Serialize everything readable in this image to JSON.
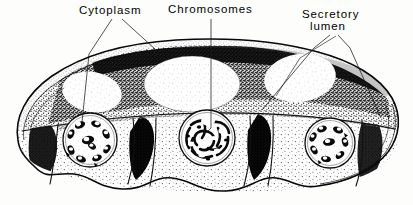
{
  "figure": {
    "kind": "histology-illustration",
    "style": "stippled pen-and-ink line drawing, black on white",
    "width": 413,
    "height": 205,
    "colors": {
      "ink": "#000000",
      "paper": "#fdfdfc",
      "stipple_light": "#8a8a8a",
      "stipple_dark": "#2b2b2b"
    }
  },
  "labels": {
    "cytoplasm": {
      "text": "Cytoplasm",
      "leader": "two-branch-v"
    },
    "chromosomes": {
      "text": "Chromosomes",
      "leader": "single-vertical"
    },
    "secretory_lumen": {
      "line1": "Secretory",
      "line2": "lumen",
      "leader": "two-branch-v"
    }
  },
  "structures": {
    "outline": "lobed oval cross-section",
    "nuclei": [
      {
        "name": "nucleus-left",
        "cx": 90,
        "cy": 140,
        "r": 27
      },
      {
        "name": "nucleus-center",
        "cx": 207,
        "cy": 138,
        "r": 28
      },
      {
        "name": "nucleus-right",
        "cx": 330,
        "cy": 143,
        "r": 25
      }
    ],
    "lumen_regions": 4,
    "cell_count": 3
  }
}
